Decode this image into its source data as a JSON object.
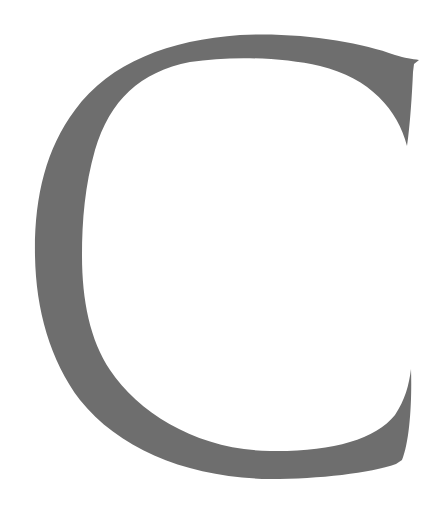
{
  "glyph": {
    "character": "C",
    "fill_color": "#6e6e6e",
    "background_color": "#ffffff"
  }
}
